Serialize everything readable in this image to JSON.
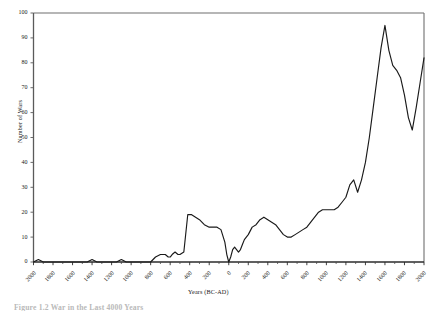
{
  "figure": {
    "caption_partial": "Figure 1.2  War in the Last 4000 Years"
  },
  "chart_data": {
    "type": "line",
    "title": "",
    "xlabel": "Years (BC-AD)",
    "ylabel": "Number of Wars",
    "xlim": [
      -2000,
      2000
    ],
    "ylim": [
      0,
      100
    ],
    "grid": false,
    "legend": "none",
    "line_color": "#1a1a1a",
    "x_tick_labels": [
      "2000",
      "1800",
      "1600",
      "1400",
      "1200",
      "1000",
      "800",
      "600",
      "400",
      "200",
      "0",
      "200",
      "400",
      "600",
      "800",
      "1000",
      "1200",
      "1400",
      "1600",
      "1800",
      "2000"
    ],
    "x_tick_values": [
      -2000,
      -1800,
      -1600,
      -1400,
      -1200,
      -1000,
      -800,
      -600,
      -400,
      -200,
      0,
      200,
      400,
      600,
      800,
      1000,
      1200,
      1400,
      1600,
      1800,
      2000
    ],
    "y_tick_labels": [
      "0",
      "10",
      "20",
      "30",
      "40",
      "50",
      "60",
      "70",
      "80",
      "90",
      "100"
    ],
    "y_tick_values": [
      0,
      10,
      20,
      30,
      40,
      50,
      60,
      70,
      80,
      90,
      100
    ],
    "x": [
      -2000,
      -1950,
      -1900,
      -1450,
      -1400,
      -1350,
      -1150,
      -1100,
      -1050,
      -800,
      -750,
      -700,
      -650,
      -620,
      -600,
      -580,
      -550,
      -520,
      -500,
      -460,
      -420,
      -380,
      -340,
      -300,
      -250,
      -200,
      -160,
      -120,
      -80,
      -40,
      -20,
      0,
      20,
      40,
      60,
      80,
      100,
      120,
      140,
      160,
      200,
      240,
      280,
      320,
      360,
      400,
      440,
      480,
      520,
      560,
      600,
      640,
      680,
      720,
      760,
      800,
      840,
      880,
      920,
      960,
      1000,
      1040,
      1080,
      1120,
      1160,
      1200,
      1240,
      1280,
      1320,
      1360,
      1400,
      1440,
      1480,
      1520,
      1560,
      1600,
      1640,
      1680,
      1720,
      1760,
      1800,
      1840,
      1880,
      1920,
      1960,
      2000
    ],
    "y": [
      0,
      1,
      0,
      0,
      1,
      0,
      0,
      1,
      0,
      0,
      2,
      3,
      3,
      2,
      2,
      3,
      4,
      3,
      3,
      4,
      19,
      19,
      18,
      17,
      15,
      14,
      14,
      14,
      13,
      8,
      3,
      0,
      2,
      5,
      6,
      5,
      4,
      5,
      7,
      9,
      11,
      14,
      15,
      17,
      18,
      17,
      16,
      15,
      13,
      11,
      10,
      10,
      11,
      12,
      13,
      14,
      16,
      18,
      20,
      21,
      21,
      21,
      21,
      22,
      24,
      26,
      31,
      33,
      28,
      33,
      40,
      50,
      62,
      74,
      86,
      95,
      85,
      79,
      77,
      74,
      67,
      58,
      53,
      62,
      72,
      82
    ],
    "series": [
      {
        "name": "Number of Wars",
        "values": [
          0,
          1,
          0,
          0,
          1,
          0,
          0,
          1,
          0,
          0,
          2,
          3,
          3,
          2,
          2,
          3,
          4,
          3,
          3,
          4,
          19,
          19,
          18,
          17,
          15,
          14,
          14,
          14,
          13,
          8,
          3,
          0,
          2,
          5,
          6,
          5,
          4,
          5,
          7,
          9,
          11,
          14,
          15,
          17,
          18,
          17,
          16,
          15,
          13,
          11,
          10,
          10,
          11,
          12,
          13,
          14,
          16,
          18,
          20,
          21,
          21,
          21,
          21,
          22,
          24,
          26,
          31,
          33,
          28,
          33,
          40,
          50,
          62,
          74,
          86,
          95,
          85,
          79,
          77,
          74,
          67,
          58,
          53,
          62,
          72,
          82
        ]
      }
    ],
    "annotations": [
      {
        "label": "peak",
        "x": 1600,
        "y": 95
      },
      {
        "label": "trough-at-year-0",
        "x": 0,
        "y": 0
      }
    ]
  }
}
